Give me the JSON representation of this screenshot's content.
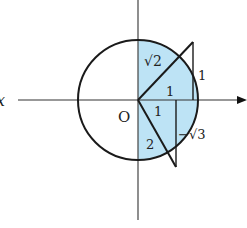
{
  "diagram": {
    "type": "unit-circle-triangles",
    "axis_label_x": "x",
    "origin_label": "O",
    "shade_color": "#bde3f5",
    "stroke_color": "#1a1a1a",
    "upper_triangle": {
      "hypotenuse_label": "√2",
      "vertical_leg_label": "1",
      "horizontal_leg_label": "1"
    },
    "lower_triangle": {
      "hypotenuse_label": "2",
      "horizontal_leg_label": "1",
      "vertical_leg_label": "−√3"
    }
  }
}
